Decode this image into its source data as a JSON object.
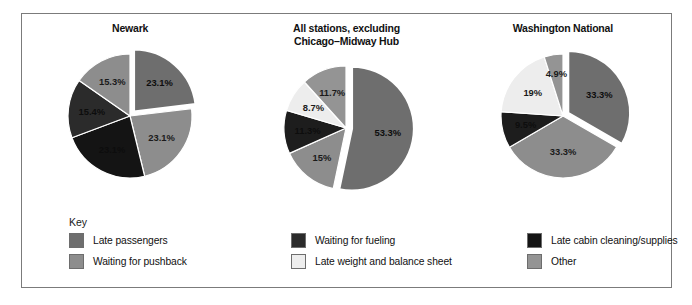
{
  "figure": {
    "key_heading": "Key"
  },
  "legend": {
    "items": [
      {
        "label": "Late passengers",
        "color": "#6e6e6e",
        "order": 0
      },
      {
        "label": "Waiting for pushback",
        "color": "#8d8d8d",
        "order": 1
      },
      {
        "label": "Waiting for fueling",
        "color": "#2b2b2b",
        "order": 2
      },
      {
        "label": "Late weight and balance sheet",
        "color": "#ededed",
        "order": 3
      },
      {
        "label": "Late cabin cleaning/supplies",
        "color": "#141414",
        "order": 4
      },
      {
        "label": "Other",
        "color": "#949494",
        "order": 5
      }
    ]
  },
  "chart_data": [
    {
      "type": "pie",
      "title": "Newark",
      "legend_position": "bottom",
      "categories": [
        "Late passengers",
        "Waiting for pushback",
        "Late cabin cleaning/supplies",
        "Waiting for fueling",
        "Other"
      ],
      "values": [
        23.1,
        23.1,
        23.1,
        15.4,
        15.3
      ],
      "labels": [
        "23.1%",
        "23.1%",
        "23.1%",
        "15.4%",
        "15.3%"
      ],
      "colors": [
        "#6e6e6e",
        "#8d8d8d",
        "#141414",
        "#2b2b2b",
        "#8d8d8d"
      ],
      "exploded": [
        true,
        false,
        false,
        false,
        false
      ]
    },
    {
      "type": "pie",
      "title": "All stations, excluding\nChicago–Midway Hub",
      "legend_position": "bottom",
      "categories": [
        "Late passengers",
        "Waiting for pushback",
        "Waiting for fueling",
        "Late weight and balance sheet",
        "Other"
      ],
      "values": [
        53.3,
        15.0,
        11.3,
        8.7,
        11.7
      ],
      "labels": [
        "53.3%",
        "15%",
        "11.3%",
        "8.7%",
        "11.7%"
      ],
      "colors": [
        "#6e6e6e",
        "#8d8d8d",
        "#1d1d1d",
        "#ededed",
        "#949494"
      ],
      "exploded": [
        true,
        false,
        false,
        false,
        false
      ]
    },
    {
      "type": "pie",
      "title": "Washington National",
      "legend_position": "bottom",
      "categories": [
        "Late passengers",
        "Waiting for pushback",
        "Waiting for fueling",
        "Late weight and balance sheet",
        "Other"
      ],
      "values": [
        33.3,
        33.3,
        9.5,
        19.0,
        4.9
      ],
      "labels": [
        "33.3%",
        "33.3%",
        "9.5%",
        "19%",
        "4.9%"
      ],
      "colors": [
        "#6e6e6e",
        "#8d8d8d",
        "#1d1d1d",
        "#ededed",
        "#949494"
      ],
      "exploded": [
        true,
        false,
        false,
        false,
        false
      ]
    }
  ]
}
